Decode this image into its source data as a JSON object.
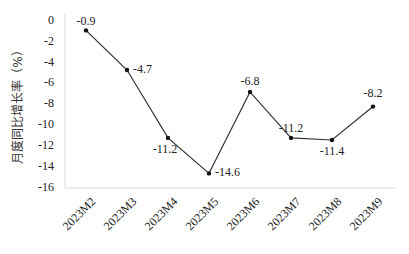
{
  "chart_data": {
    "type": "line",
    "title": "",
    "xlabel": "",
    "ylabel": "月度同比增长率（%）",
    "categories": [
      "2023M2",
      "2023M3",
      "2023M4",
      "2023M5",
      "2023M6",
      "2023M7",
      "2023M8",
      "2023M9"
    ],
    "series": [
      {
        "name": "月度同比增长率",
        "values": [
          -0.9,
          -4.7,
          -11.2,
          -14.6,
          -6.8,
          -11.2,
          -11.4,
          -8.2
        ]
      }
    ],
    "data_labels": [
      "-0.9",
      "-4.7",
      "-11.2",
      "-14.6",
      "-6.8",
      "-11.2",
      "-11.4",
      "-8.2"
    ],
    "ylim": [
      -16,
      0
    ],
    "yticks": [
      0,
      -2,
      -4,
      -6,
      -8,
      -10,
      -12,
      -14,
      -16
    ],
    "ytick_labels": [
      "0",
      "-2",
      "-4",
      "-6",
      "-8",
      "-10",
      "-12",
      "-14",
      "-16"
    ],
    "grid": false,
    "legend": null,
    "colors": {
      "line": "#333333",
      "marker": "#111111",
      "axis": "#d9d9d9"
    }
  }
}
